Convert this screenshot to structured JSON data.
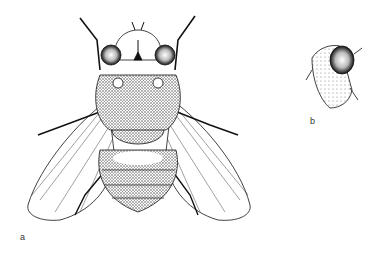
{
  "figure": {
    "panels": [
      {
        "id": "a",
        "label": "a",
        "description": "Fly, dorsal view"
      },
      {
        "id": "b",
        "label": "b",
        "description": "Head, lateral view"
      }
    ],
    "colors": {
      "ink": "#111111",
      "background": "#ffffff",
      "stipple": "#555555"
    }
  }
}
